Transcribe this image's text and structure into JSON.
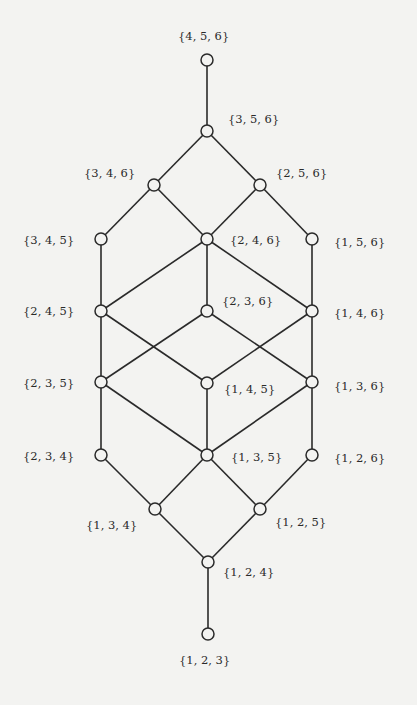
{
  "diagram": {
    "type": "hasse-diagram",
    "colors": {
      "background": "#f3f3f1",
      "edge": "#2a2a2a",
      "node_fill": "#f3f3f1",
      "node_stroke": "#2a2a2a",
      "label": "#2a2a2a"
    },
    "nodes": [
      {
        "id": "456",
        "label": "{4, 5, 6}",
        "x": 207,
        "y": 60,
        "lx": 178,
        "ly": 29,
        "anchor": "left"
      },
      {
        "id": "356",
        "label": "{3, 5, 6}",
        "x": 207,
        "y": 131,
        "lx": 228,
        "ly": 112,
        "anchor": "left"
      },
      {
        "id": "346",
        "label": "{3, 4, 6}",
        "x": 154,
        "y": 185,
        "lx": 84,
        "ly": 166,
        "anchor": "left"
      },
      {
        "id": "256",
        "label": "{2, 5, 6}",
        "x": 260,
        "y": 185,
        "lx": 276,
        "ly": 166,
        "anchor": "left"
      },
      {
        "id": "345",
        "label": "{3, 4, 5}",
        "x": 101,
        "y": 239,
        "lx": 23,
        "ly": 233,
        "anchor": "left"
      },
      {
        "id": "246",
        "label": "{2, 4, 6}",
        "x": 207,
        "y": 239,
        "lx": 230,
        "ly": 233,
        "anchor": "left"
      },
      {
        "id": "156",
        "label": "{1, 5, 6}",
        "x": 312,
        "y": 239,
        "lx": 334,
        "ly": 235,
        "anchor": "left"
      },
      {
        "id": "245",
        "label": "{2, 4, 5}",
        "x": 101,
        "y": 311,
        "lx": 23,
        "ly": 304,
        "anchor": "left"
      },
      {
        "id": "236",
        "label": "{2, 3, 6}",
        "x": 207,
        "y": 311,
        "lx": 222,
        "ly": 294,
        "anchor": "left"
      },
      {
        "id": "146",
        "label": "{1, 4, 6}",
        "x": 312,
        "y": 311,
        "lx": 334,
        "ly": 306,
        "anchor": "left"
      },
      {
        "id": "235",
        "label": "{2, 3, 5}",
        "x": 101,
        "y": 382,
        "lx": 23,
        "ly": 376,
        "anchor": "left"
      },
      {
        "id": "145",
        "label": "{1, 4, 5}",
        "x": 207,
        "y": 383,
        "lx": 224,
        "ly": 382,
        "anchor": "left"
      },
      {
        "id": "136",
        "label": "{1, 3, 6}",
        "x": 312,
        "y": 382,
        "lx": 334,
        "ly": 379,
        "anchor": "left"
      },
      {
        "id": "234",
        "label": "{2, 3, 4}",
        "x": 101,
        "y": 455,
        "lx": 23,
        "ly": 449,
        "anchor": "left"
      },
      {
        "id": "135",
        "label": "{1, 3, 5}",
        "x": 207,
        "y": 455,
        "lx": 231,
        "ly": 450,
        "anchor": "left"
      },
      {
        "id": "126",
        "label": "{1, 2, 6}",
        "x": 312,
        "y": 455,
        "lx": 334,
        "ly": 451,
        "anchor": "left"
      },
      {
        "id": "134",
        "label": "{1, 3, 4}",
        "x": 155,
        "y": 509,
        "lx": 86,
        "ly": 518,
        "anchor": "left"
      },
      {
        "id": "125",
        "label": "{1, 2, 5}",
        "x": 260,
        "y": 509,
        "lx": 275,
        "ly": 515,
        "anchor": "left"
      },
      {
        "id": "124",
        "label": "{1, 2, 4}",
        "x": 208,
        "y": 562,
        "lx": 223,
        "ly": 565,
        "anchor": "left"
      },
      {
        "id": "123",
        "label": "{1, 2, 3}",
        "x": 208,
        "y": 634,
        "lx": 179,
        "ly": 653,
        "anchor": "left"
      }
    ],
    "edges": [
      [
        "456",
        "356"
      ],
      [
        "356",
        "346"
      ],
      [
        "356",
        "256"
      ],
      [
        "346",
        "345"
      ],
      [
        "346",
        "246"
      ],
      [
        "256",
        "246"
      ],
      [
        "256",
        "156"
      ],
      [
        "345",
        "245"
      ],
      [
        "246",
        "245"
      ],
      [
        "246",
        "236"
      ],
      [
        "246",
        "146"
      ],
      [
        "156",
        "146"
      ],
      [
        "245",
        "235"
      ],
      [
        "245",
        "145"
      ],
      [
        "236",
        "235"
      ],
      [
        "236",
        "136"
      ],
      [
        "146",
        "145"
      ],
      [
        "146",
        "136"
      ],
      [
        "235",
        "234"
      ],
      [
        "235",
        "135"
      ],
      [
        "145",
        "135"
      ],
      [
        "136",
        "135"
      ],
      [
        "136",
        "126"
      ],
      [
        "234",
        "134"
      ],
      [
        "135",
        "134"
      ],
      [
        "135",
        "125"
      ],
      [
        "126",
        "125"
      ],
      [
        "134",
        "124"
      ],
      [
        "125",
        "124"
      ],
      [
        "124",
        "123"
      ]
    ],
    "node_radius": 6
  }
}
